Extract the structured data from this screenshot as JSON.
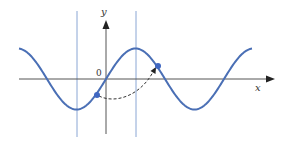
{
  "figure": {
    "type": "sine-wave-diagram",
    "labels": {
      "y_axis": "y",
      "x_axis": "x",
      "origin": "0"
    },
    "colors": {
      "curve": "#4a6fb5",
      "guide_lines": "#8aa6d4",
      "axes": "#555555",
      "points": "#3f67c2",
      "dashed_arrow": "#333333"
    }
  },
  "chart_data": {
    "type": "line",
    "title": "",
    "xlabel": "x",
    "ylabel": "y",
    "series": [
      {
        "name": "sine curve",
        "function": "y = sin(x)",
        "x_range": [
          -3.14159,
          7.67
        ],
        "amplitude": 1,
        "period": 6.28318
      }
    ],
    "vertical_lines_x": [
      -1.5708,
      1.5708
    ],
    "points": [
      {
        "label": "point-1",
        "x": -0.47,
        "y": -0.45
      },
      {
        "label": "point-2",
        "x": 2.67,
        "y": 0.45
      }
    ],
    "annotation": "dashed curved arrow from point-1 to point-2",
    "grid": false,
    "legend": "none"
  }
}
